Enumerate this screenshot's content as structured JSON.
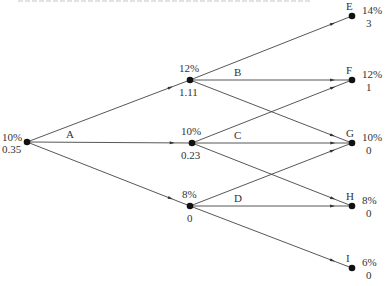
{
  "diagram": {
    "type": "lattice-tree",
    "top_fragment_text": "",
    "nodes": [
      {
        "id": "root",
        "x": 27,
        "y": 142,
        "rate": "10%",
        "value": "0.35",
        "name": ""
      },
      {
        "id": "n12",
        "x": 190,
        "y": 80,
        "rate": "12%",
        "value": "1.11",
        "name": ""
      },
      {
        "id": "n10",
        "x": 192,
        "y": 143,
        "rate": "10%",
        "value": "0.23",
        "name": ""
      },
      {
        "id": "n8",
        "x": 190,
        "y": 206,
        "rate": "8%",
        "value": "0",
        "name": ""
      },
      {
        "id": "E",
        "x": 352,
        "y": 16,
        "rate": "14%",
        "value": "3",
        "name": "E"
      },
      {
        "id": "F",
        "x": 352,
        "y": 80,
        "rate": "12%",
        "value": "1",
        "name": "F"
      },
      {
        "id": "G",
        "x": 352,
        "y": 143,
        "rate": "10%",
        "value": "0",
        "name": "G"
      },
      {
        "id": "H",
        "x": 352,
        "y": 206,
        "rate": "8%",
        "value": "0",
        "name": "H"
      },
      {
        "id": "I",
        "x": 352,
        "y": 268,
        "rate": "6%",
        "value": "0",
        "name": "I"
      }
    ],
    "edges": [
      {
        "from": "root",
        "to": "n12"
      },
      {
        "from": "root",
        "to": "n10"
      },
      {
        "from": "root",
        "to": "n8"
      },
      {
        "from": "n12",
        "to": "E"
      },
      {
        "from": "n12",
        "to": "F"
      },
      {
        "from": "n12",
        "to": "G"
      },
      {
        "from": "n10",
        "to": "F"
      },
      {
        "from": "n10",
        "to": "G"
      },
      {
        "from": "n10",
        "to": "H"
      },
      {
        "from": "n8",
        "to": "G"
      },
      {
        "from": "n8",
        "to": "H"
      },
      {
        "from": "n8",
        "to": "I"
      }
    ],
    "edge_labels": [
      {
        "text": "A",
        "x": 66,
        "y": 129
      },
      {
        "text": "B",
        "x": 234,
        "y": 67
      },
      {
        "text": "C",
        "x": 234,
        "y": 130
      },
      {
        "text": "D",
        "x": 234,
        "y": 193
      }
    ],
    "colors": {
      "line": "#444444",
      "node": "#111111",
      "text": "#333333"
    }
  }
}
